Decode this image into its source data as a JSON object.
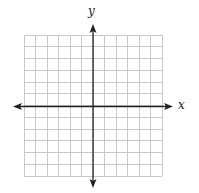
{
  "diagram": {
    "type": "coordinate-plane",
    "axes": {
      "x_label": "x",
      "y_label": "y",
      "arrows": "both-ends"
    },
    "grid": {
      "columns": 12,
      "rows": 12,
      "columns_left_of_y_axis": 6,
      "columns_right_of_y_axis": 6,
      "rows_above_x_axis": 6,
      "rows_below_x_axis": 6,
      "line_color": "#c8c8c8",
      "axis_color": "#222222"
    }
  }
}
